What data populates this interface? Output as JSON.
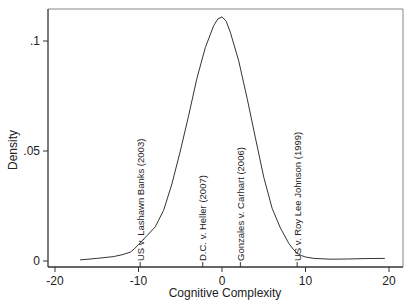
{
  "chart_data": {
    "type": "line",
    "title": "",
    "xlabel": "Cognitive Complexity",
    "ylabel": "Density",
    "xlim": [
      -20,
      20
    ],
    "ylim": [
      0,
      0.113
    ],
    "x_ticks": [
      {
        "value": -20,
        "label": "-20"
      },
      {
        "value": -10,
        "label": "-10"
      },
      {
        "value": 0,
        "label": "0"
      },
      {
        "value": 10,
        "label": "10"
      },
      {
        "value": 20,
        "label": "20"
      }
    ],
    "y_ticks": [
      {
        "value": 0,
        "label": "0"
      },
      {
        "value": 0.05,
        "label": ".05"
      },
      {
        "value": 0.1,
        "label": ".1"
      }
    ],
    "grid": false,
    "legend": null,
    "series": [
      {
        "name": "Kernel density",
        "x": [
          -17,
          -15,
          -13,
          -12,
          -11,
          -10.5,
          -10,
          -9.5,
          -9,
          -8,
          -7,
          -6,
          -5,
          -4,
          -3,
          -2,
          -1,
          -0.5,
          0,
          0.5,
          1,
          2,
          3,
          4,
          5,
          6,
          7,
          8,
          8.5,
          9,
          9.5,
          10,
          11,
          13,
          15,
          17,
          19.5
        ],
        "y": [
          0.0005,
          0.0012,
          0.002,
          0.0028,
          0.004,
          0.0055,
          0.0075,
          0.0095,
          0.0115,
          0.0155,
          0.023,
          0.035,
          0.05,
          0.066,
          0.083,
          0.097,
          0.107,
          0.11,
          0.111,
          0.109,
          0.104,
          0.091,
          0.074,
          0.056,
          0.038,
          0.024,
          0.015,
          0.008,
          0.0055,
          0.0035,
          0.0025,
          0.0018,
          0.0012,
          0.0008,
          0.0009,
          0.0011,
          0.0012
        ]
      }
    ],
    "annotations": [
      {
        "x": -9.8,
        "label": "US v. Lashawn Banks (2003)"
      },
      {
        "x": -2.3,
        "label": "D.C. v. Heller (2007)"
      },
      {
        "x": 2.2,
        "label": "Gonzales v. Carhart (2006)"
      },
      {
        "x": 9.0,
        "label": "US v. Roy Lee Johnson (1999)"
      }
    ]
  }
}
